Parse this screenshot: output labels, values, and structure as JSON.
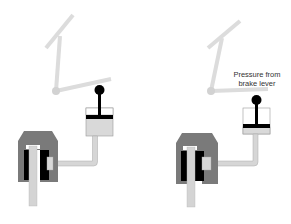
{
  "colors": {
    "background": "#ffffff",
    "lever": "#dcdcdc",
    "pivot": "#d2d2d2",
    "knob": "#000000",
    "piston_bar": "#000000",
    "fluid": "#d9d9d9",
    "cylinder_outline": "#9a9a9a",
    "pipe": "#d6d6d6",
    "pipe_outline": "#a8a8a8",
    "caliper_housing": "#7a7a7a",
    "brake_pad": "#000000",
    "rotor": "#d4d4d4",
    "caliper_piston": "#d8d8d8"
  },
  "panels": [
    {
      "id": "released",
      "label": null
    },
    {
      "id": "applied",
      "label": "Pressure from brake lever"
    }
  ],
  "labels": {
    "pressure_line1": "Pressure from",
    "pressure_line2": "brake lever"
  }
}
